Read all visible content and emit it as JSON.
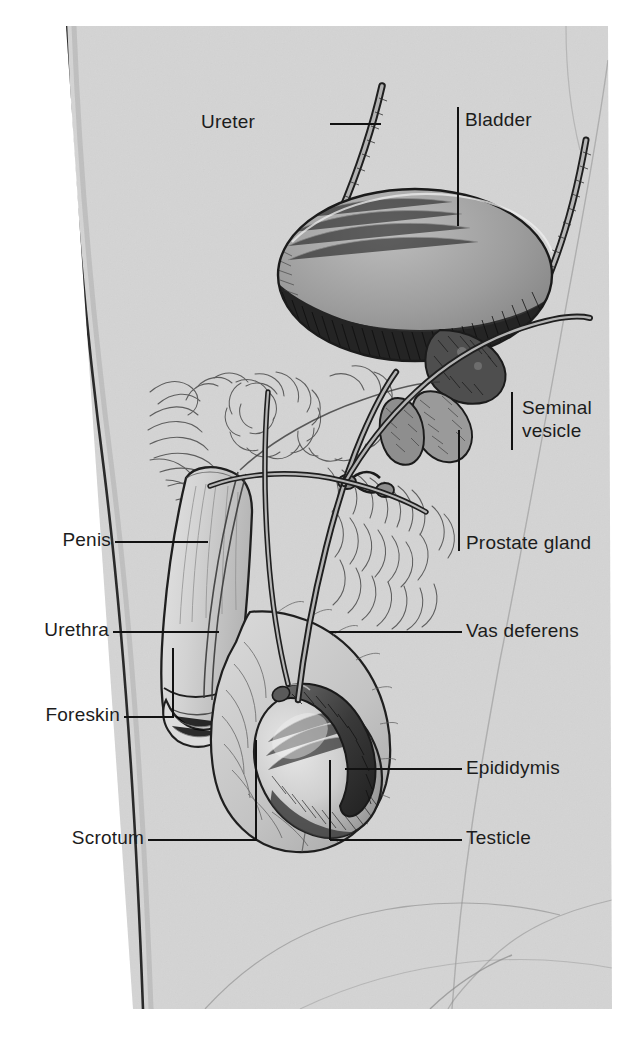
{
  "figure": {
    "view": "sagittal / lateral cutaway of the male pelvis",
    "background_color": "#ffffff",
    "plate_color": "#d6d6d6",
    "ink_color": "#1c1c1c"
  },
  "labels": [
    {
      "id": "ureter",
      "text": "Ureter",
      "side": "left",
      "text_x": 255,
      "text_y": 110,
      "leader": "horizontal",
      "leader_from_x": 330,
      "leader_from_y": 124,
      "leader_to_x": 381,
      "leader_to_y": 124
    },
    {
      "id": "bladder",
      "text": "Bladder",
      "side": "right",
      "text_x": 465,
      "text_y": 108,
      "leader": "vertical",
      "leader_from_x": 458,
      "leader_from_y": 107,
      "leader_to_x": 458,
      "leader_to_y": 226
    },
    {
      "id": "seminal-vesicle",
      "text": "Seminal\nvesicle",
      "side": "right",
      "text_x": 522,
      "text_y": 396,
      "leader": "vertical",
      "leader_from_x": 512,
      "leader_from_y": 392,
      "leader_to_x": 512,
      "leader_to_y": 450
    },
    {
      "id": "prostate-gland",
      "text": "Prostate gland",
      "side": "right",
      "text_x": 466,
      "text_y": 531,
      "leader": "vertical",
      "leader_from_x": 459,
      "leader_from_y": 430,
      "leader_to_x": 459,
      "leader_to_y": 551
    },
    {
      "id": "penis",
      "text": "Penis",
      "side": "left",
      "text_x": 57,
      "text_y": 528,
      "leader": "horizontal",
      "leader_from_x": 115,
      "leader_from_y": 542,
      "leader_to_x": 208,
      "leader_to_y": 542
    },
    {
      "id": "urethra",
      "text": "Urethra",
      "side": "left",
      "text_x": 40,
      "text_y": 618,
      "leader": "horizontal",
      "leader_from_x": 113,
      "leader_from_y": 632,
      "leader_to_x": 219,
      "leader_to_y": 632
    },
    {
      "id": "vas-deferens",
      "text": "Vas deferens",
      "side": "right",
      "text_x": 466,
      "text_y": 619,
      "leader": "horizontal",
      "leader_from_x": 329,
      "leader_from_y": 632,
      "leader_to_x": 462,
      "leader_to_y": 632
    },
    {
      "id": "foreskin",
      "text": "Foreskin",
      "side": "left",
      "text_x": 57,
      "text_y": 703,
      "leader": "elbow-up",
      "leader_from_x": 124,
      "leader_from_y": 717,
      "leader_to_x": 173,
      "leader_to_y": 717,
      "elbow_y": 648
    },
    {
      "id": "epididymis",
      "text": "Epididymis",
      "side": "right",
      "text_x": 466,
      "text_y": 756,
      "leader": "horizontal",
      "leader_from_x": 345,
      "leader_from_y": 769,
      "leader_to_x": 462,
      "leader_to_y": 769
    },
    {
      "id": "scrotum",
      "text": "Scrotum",
      "side": "left",
      "text_x": 73,
      "text_y": 826,
      "leader": "elbow-up",
      "leader_from_x": 148,
      "leader_from_y": 840,
      "leader_to_x": 256,
      "leader_to_y": 840,
      "elbow_y": 740
    },
    {
      "id": "testicle",
      "text": "Testicle",
      "side": "right",
      "text_x": 466,
      "text_y": 826,
      "leader": "elbow-up",
      "leader_from_x": 330,
      "leader_from_y": 840,
      "leader_to_x": 462,
      "leader_to_y": 840,
      "elbow_y": 760
    }
  ],
  "structures": [
    {
      "id": "bladder",
      "name": "Bladder",
      "rendering": "large domed sac, upper lobe light gray, lower half dark cross-hatched"
    },
    {
      "id": "ureter",
      "name": "Ureter",
      "rendering": "narrow tube descending from upper left into bladder"
    },
    {
      "id": "ureter-right",
      "name": "Ureter (right)",
      "rendering": "narrow tube descending from upper right into bladder"
    },
    {
      "id": "seminal-vesicle",
      "name": "Seminal vesicle",
      "rendering": "two small lobed pouches beneath the bladder neck"
    },
    {
      "id": "prostate-gland",
      "name": "Prostate gland",
      "rendering": "rounded mass at the bladder outlet"
    },
    {
      "id": "vas-deferens",
      "name": "Vas deferens",
      "rendering": "long looping duct from epididymis up over the bladder"
    },
    {
      "id": "penis",
      "name": "Penis",
      "rendering": "shaft descending forward and down, lightly shaded"
    },
    {
      "id": "urethra",
      "name": "Urethra",
      "rendering": "channel running the length of the penile shaft"
    },
    {
      "id": "foreskin",
      "name": "Foreskin",
      "rendering": "fold at distal end of the shaft"
    },
    {
      "id": "scrotum",
      "name": "Scrotum",
      "rendering": "hair-stippled sac enclosing the testicle"
    },
    {
      "id": "testicle",
      "name": "Testicle",
      "rendering": "oval body inside scrotum, pale center with shaded rim"
    },
    {
      "id": "epididymis",
      "name": "Epididymis",
      "rendering": "dark crescent capping the posterior testicle"
    },
    {
      "id": "pubic-hair",
      "name": "Pubic hair",
      "rendering": "swirled line-work above the penis root"
    },
    {
      "id": "body-outline",
      "name": "Body outline",
      "rendering": "curved torso and thigh contours framing the plate"
    }
  ]
}
